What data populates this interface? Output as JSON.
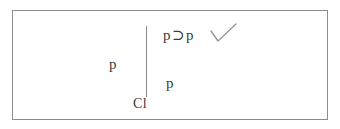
{
  "figure": {
    "kind": "semantic-tableau",
    "border_color": "#8c8c8c",
    "line_color": "#8a8a8a",
    "text_color": "#3a3a3a",
    "background": "#ffffff",
    "branch_line": {
      "label": "vertical-branch-line"
    },
    "nodes": {
      "root_left": "p",
      "root_operator": "⊃",
      "root_right": "p",
      "left_premise": "p",
      "branch_entry": "p",
      "closure_label": "Cl"
    },
    "checkmark": {
      "name": "check-mark",
      "glyph": "✓"
    }
  }
}
